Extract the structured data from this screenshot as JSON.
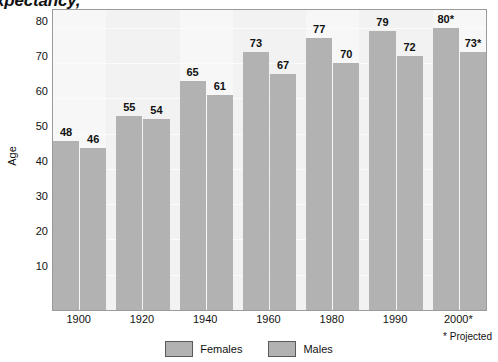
{
  "title": {
    "text": "Life Expectancy,",
    "note": "clipped at top edge of image"
  },
  "axes": {
    "y_label": "Age",
    "y_ticks": [
      "80",
      "70",
      "60",
      "50",
      "40",
      "30",
      "20",
      "10"
    ],
    "x_ticks": [
      "1900",
      "1920",
      "1940",
      "1960",
      "1980",
      "1990",
      "2000*"
    ]
  },
  "footnote": "* Projected",
  "legend": {
    "items": [
      {
        "label": "Females",
        "color": "#b2b2b2"
      },
      {
        "label": "Males",
        "color": "#b2b2b2"
      }
    ]
  },
  "bar_labels": {
    "females": [
      "48",
      "55",
      "65",
      "73",
      "77",
      "79",
      "80*"
    ],
    "males": [
      "46",
      "54",
      "61",
      "67",
      "70",
      "72",
      "73*"
    ]
  },
  "chart_data": {
    "type": "bar",
    "title": "Life Expectancy,",
    "xlabel": "",
    "ylabel": "Age",
    "categories": [
      "1900",
      "1920",
      "1940",
      "1960",
      "1980",
      "1990",
      "2000*"
    ],
    "series": [
      {
        "name": "Females",
        "values": [
          48,
          55,
          65,
          73,
          77,
          79,
          80
        ],
        "color": "#b2b2b2"
      },
      {
        "name": "Males",
        "values": [
          46,
          54,
          61,
          67,
          70,
          72,
          73
        ],
        "color": "#b2b2b2"
      }
    ],
    "data_labels": {
      "Females": [
        "48",
        "55",
        "65",
        "73",
        "77",
        "79",
        "80*"
      ],
      "Males": [
        "46",
        "54",
        "61",
        "67",
        "70",
        "72",
        "73*"
      ]
    },
    "ylim": [
      0,
      85
    ],
    "ytick_values": [
      10,
      20,
      30,
      40,
      50,
      60,
      70,
      80
    ],
    "grid": true,
    "legend_position": "bottom",
    "annotations": [
      "* Projected"
    ]
  }
}
